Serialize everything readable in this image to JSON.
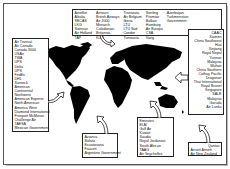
{
  "figure": {
    "boxes": {
      "europe_north": {
        "columns": [
          [
            "Aeroflot",
            "Alitalia",
            "SECAS",
            "LKG",
            "Swissair",
            "Air Holland",
            "TAP"
          ],
          [
            "Airtours",
            "British Airways",
            "Air 2000",
            "Monarch",
            "Caledonian",
            "Britannia",
            "KLM"
          ],
          [
            "Transavia",
            "Air Belgium",
            "Iberia",
            "LTU",
            "LTU Süd",
            "Condor",
            "Tunisavia"
          ],
          [
            "Sterling",
            "Premiair",
            "Balkan",
            "Hamburg",
            "Air Europa",
            "CSA",
            "Varig"
          ],
          [
            "Azerbaijan",
            "Turkmenistan",
            "Government"
          ]
        ]
      },
      "north_america": {
        "items": [
          "Air Transat",
          "Air Canada",
          "Canada 3000",
          "USAir",
          "TWA",
          "UPS",
          "Delta",
          "UPS",
          "FedEx",
          "DHL",
          "Sunrock",
          "American",
          "Continental",
          "Northwest",
          "American Express",
          "North American",
          "America West",
          "Diamond International",
          "Freeport McMoran",
          "Challenge Air",
          "TAESA",
          "Mexican Government"
        ]
      },
      "asia": {
        "items": [
          "CAAC",
          "Xiamen",
          "China Southwest",
          "Hua",
          "Xinjiang",
          "Royal Nepal",
          "Yunnan",
          "Malaysia",
          "Wuhan",
          "China Southern",
          "Cathay Pacific",
          "Dragonair",
          "Thai International",
          "Royal Brunei",
          "Singapore",
          "SALE",
          "Malaysia",
          "Garuda",
          "Air Lanka"
        ]
      },
      "south_america": {
        "items": [
          "Avianca",
          "Bolivia",
          "Ecuatoriana",
          "Faucett",
          "Argentine Government"
        ]
      },
      "middle_east_africa": {
        "items": [
          "Emirates",
          "El Al",
          "Gulf Air",
          "Kuwait",
          "Saudia",
          "Royal Jordanian",
          "South African",
          "TAAG",
          "Air Seychelles"
        ]
      },
      "oceania": {
        "rows": [
          [
            "",
            "Qantas"
          ],
          [
            "Ansett",
            "Ansett"
          ],
          [
            "Air New",
            "Zealand"
          ]
        ]
      }
    },
    "colors": {
      "land": "#000000",
      "background": "#ffffff",
      "border": "#222222"
    }
  }
}
